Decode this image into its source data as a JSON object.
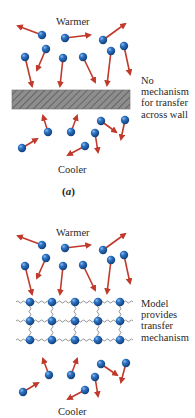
{
  "panel_a": {
    "top_label": "Warmer",
    "bottom_label": "Cooler",
    "side_note": [
      "No",
      "mechanism",
      "for transfer",
      "across wall"
    ],
    "caption_open": "(",
    "caption_letter": "a",
    "caption_close": ")",
    "divider": "hatched-wall"
  },
  "panel_b": {
    "top_label": "Warmer",
    "bottom_label": "Cooler",
    "side_note": [
      "Model",
      "provides",
      "transfer",
      "mechanism"
    ],
    "divider": "spring-lattice",
    "lattice": {
      "rows": 3,
      "columns": 5
    }
  },
  "colors": {
    "molecule": "#1f5fa8",
    "molecule_highlight": "#6fa6e0",
    "arrow": "#c0392b",
    "wall_fill": "#8a8a8a",
    "wall_hatch": "#5e5e5e",
    "spring": "#777777",
    "text": "#2a2a2a"
  }
}
